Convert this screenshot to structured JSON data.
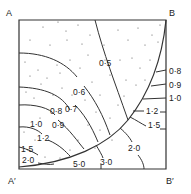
{
  "figure": {
    "corners": {
      "top_left": "A",
      "top_right": "B",
      "bottom_left": "A′",
      "bottom_right": "B′"
    },
    "stippled_region_contours": [
      {
        "value": "0·5"
      },
      {
        "value": "0·6"
      },
      {
        "value": "0·7"
      },
      {
        "value": "0·8"
      },
      {
        "value": "0·9"
      },
      {
        "value": "1·0"
      },
      {
        "value": "1·2"
      },
      {
        "value": "1·5"
      },
      {
        "value": "2·0"
      },
      {
        "value": "5·0"
      }
    ],
    "right_side_contours": [
      {
        "value": "0·8"
      },
      {
        "value": "0·9"
      },
      {
        "value": "1·0"
      },
      {
        "value": "1·2"
      },
      {
        "value": "1·5"
      },
      {
        "value": "2·0"
      },
      {
        "value": "3·0"
      }
    ],
    "colors": {
      "line": "#333333",
      "background": "#ffffff",
      "stipple": "#555555"
    }
  }
}
